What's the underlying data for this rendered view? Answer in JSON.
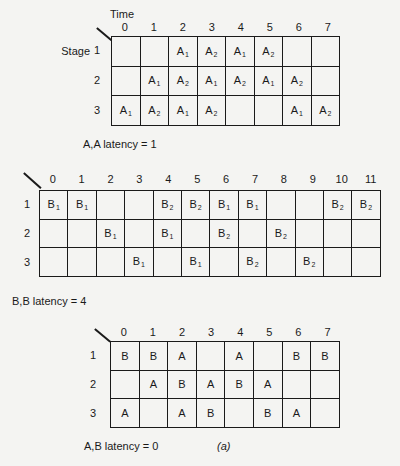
{
  "table1": {
    "time_label": "Time",
    "stage_label": "Stage",
    "columns": [
      "0",
      "1",
      "2",
      "3",
      "4",
      "5",
      "6",
      "7"
    ],
    "rows": [
      {
        "label": "1",
        "cells": [
          "",
          "",
          "A1",
          "A2",
          "A1",
          "A2",
          "",
          ""
        ]
      },
      {
        "label": "2",
        "cells": [
          "",
          "A1",
          "A2",
          "A1",
          "A2",
          "A1",
          "A2",
          ""
        ]
      },
      {
        "label": "3",
        "cells": [
          "A1",
          "A2",
          "A1",
          "A2",
          "",
          "",
          "A1",
          "A2"
        ]
      }
    ],
    "caption": "A,A latency = 1"
  },
  "table2": {
    "columns": [
      "0",
      "1",
      "2",
      "3",
      "4",
      "5",
      "6",
      "7",
      "8",
      "9",
      "10",
      "11"
    ],
    "rows": [
      {
        "label": "1",
        "cells": [
          "B1",
          "B1",
          "",
          "",
          "B2",
          "B2",
          "B1",
          "B1",
          "",
          "",
          "B2",
          "B2"
        ]
      },
      {
        "label": "2",
        "cells": [
          "",
          "",
          "B1",
          "",
          "B1",
          "",
          "B2",
          "",
          "B2",
          "",
          "",
          ""
        ]
      },
      {
        "label": "3",
        "cells": [
          "",
          "",
          "",
          "B1",
          "",
          "B1",
          "",
          "B2",
          "",
          "B2",
          "",
          ""
        ]
      }
    ],
    "caption": "B,B latency = 4"
  },
  "table3": {
    "columns": [
      "0",
      "1",
      "2",
      "3",
      "4",
      "5",
      "6",
      "7"
    ],
    "rows": [
      {
        "label": "1",
        "cells": [
          "B",
          "B",
          "A",
          "",
          "A",
          "",
          "B",
          "B"
        ]
      },
      {
        "label": "2",
        "cells": [
          "",
          "A",
          "B",
          "A",
          "B",
          "A",
          "",
          ""
        ]
      },
      {
        "label": "3",
        "cells": [
          "A",
          "",
          "A",
          "B",
          "",
          "B",
          "A",
          ""
        ]
      }
    ],
    "caption": "A,B latency = 0",
    "figure_label": "(a)"
  }
}
